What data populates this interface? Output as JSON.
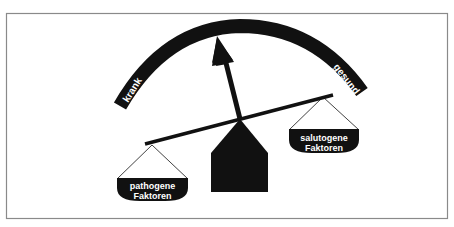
{
  "diagram": {
    "type": "balance-scale",
    "arc_labels": {
      "left": "krank",
      "right": "gesund"
    },
    "pans": {
      "left": {
        "line1": "pathogene",
        "line2": "Faktoren"
      },
      "right": {
        "line1": "salutogene",
        "line2": "Faktoren"
      }
    },
    "colors": {
      "ink": "#111111",
      "frame": "#8a8a8a",
      "background": "#ffffff",
      "label_text": "#ffffff"
    }
  }
}
